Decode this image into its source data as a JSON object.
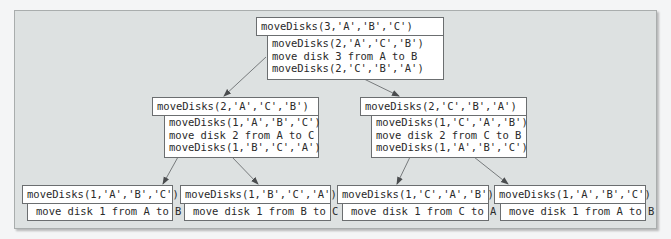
{
  "diagram": {
    "colors": {
      "panel_bg": "#dde1e1",
      "box_bg": "#ffffff",
      "border": "#6b6e70",
      "arrow": "#6b6e70",
      "text": "#2a2a2a"
    },
    "root": {
      "call": "moveDisks(3,'A','B','C')",
      "steps": [
        "moveDisks(2,'A','C','B')",
        "move disk 3 from A to B",
        "moveDisks(2,'C','B','A')"
      ]
    },
    "level2": [
      {
        "call": "moveDisks(2,'A','C','B')",
        "steps": [
          "moveDisks(1,'A','B','C')",
          "move disk 2 from A to C",
          "moveDisks(1,'B','C','A')"
        ]
      },
      {
        "call": "moveDisks(2,'C','B','A')",
        "steps": [
          "moveDisks(1,'C','A','B')",
          "move disk 2 from C to B",
          "moveDisks(1,'A','B','C')"
        ]
      }
    ],
    "leaves": [
      {
        "call": "moveDisks(1,'A','B','C')",
        "step": "move disk 1 from A to B"
      },
      {
        "call": "moveDisks(1,'B','C','A')",
        "step": "move disk 1 from B to C"
      },
      {
        "call": "moveDisks(1,'C','A','B')",
        "step": "move disk 1 from C to A"
      },
      {
        "call": "moveDisks(1,'A','B','C')",
        "step": "move disk 1 from A to B"
      }
    ]
  }
}
